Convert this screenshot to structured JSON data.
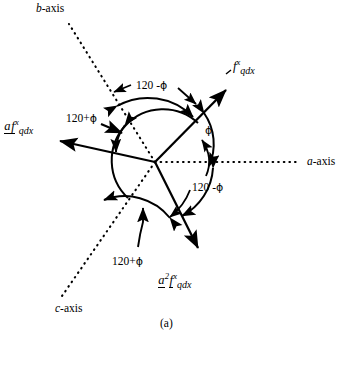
{
  "figure": {
    "caption": "(a)",
    "origin": {
      "x": 155,
      "y": 162
    },
    "axes": [
      {
        "name": "b-axis",
        "letter": "b",
        "suffix": "-axis",
        "style": "dotted",
        "angle_deg": 120,
        "label_pos": {
          "x": 36,
          "y": 3
        }
      },
      {
        "name": "a-axis",
        "letter": "a",
        "suffix": "-axis",
        "style": "dotted",
        "angle_deg": 0,
        "label_pos": {
          "x": 307,
          "y": 156
        }
      },
      {
        "name": "c-axis",
        "letter": "c",
        "suffix": "-axis",
        "style": "dotted",
        "angle_deg": 240,
        "label_pos": {
          "x": 55,
          "y": 303
        }
      }
    ],
    "vectors": [
      {
        "id": "f-qdx",
        "base": "f",
        "prefix": "",
        "prefix_sup": "",
        "sup": "x",
        "sub": "qdx",
        "angle_deg": 36,
        "label_pos": {
          "x": 233,
          "y": 58
        },
        "tip": {
          "x": 228,
          "y": 88
        }
      },
      {
        "id": "a-f-qdx",
        "base": "f",
        "prefix": "a",
        "prefix_sup": "",
        "sup": "x",
        "sub": "qdx",
        "angle_deg": 156,
        "label_pos": {
          "x": 4,
          "y": 118
        },
        "tip": {
          "x": 55,
          "y": 140
        }
      },
      {
        "id": "a2-f-qdx",
        "base": "f",
        "prefix": "a",
        "prefix_sup": "2",
        "sup": "x",
        "sub": "qdx",
        "angle_deg": 276,
        "label_pos": {
          "x": 158,
          "y": 272
        },
        "tip": {
          "x": 200,
          "y": 252
        }
      }
    ],
    "annotations": [
      {
        "id": "phi-a-axis",
        "text": "ϕ",
        "pos": {
          "x": 205,
          "y": 125
        },
        "meaning": "phi between a-axis and f-vector"
      },
      {
        "id": "angle-120-minus-phi-top",
        "text_num": "120 -",
        "text_sym": "ϕ",
        "pos": {
          "x": 136,
          "y": 80
        },
        "meaning": "120 minus phi, between b-axis and f-vector"
      },
      {
        "id": "angle-120-plus-phi-left",
        "text_num": "120+",
        "text_sym": "ϕ",
        "pos": {
          "x": 66,
          "y": 113
        },
        "meaning": "120 plus phi, between b-axis and a-f-vector"
      },
      {
        "id": "angle-120-minus-phi-right",
        "text_num": "120 -",
        "text_sym": "ϕ",
        "pos": {
          "x": 192,
          "y": 182
        },
        "meaning": "120 minus phi, between a-axis and a2-f-vector"
      },
      {
        "id": "angle-120-plus-phi-bottom",
        "text_num": "120+",
        "text_sym": "ϕ",
        "pos": {
          "x": 112,
          "y": 256
        },
        "meaning": "120 plus phi, between c-axis and a2-f-vector"
      }
    ],
    "colors": {
      "ink": "#000000",
      "background": "#ffffff"
    }
  }
}
